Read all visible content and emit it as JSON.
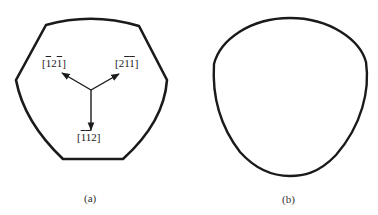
{
  "figure": {
    "panels": [
      {
        "id": "a",
        "caption": "(a)",
        "shape": "truncated-hexagonal cross-section",
        "directions": [
          {
            "label_prefix": "[",
            "parts": [
              {
                "t": "1",
                "bar": true
              },
              {
                "t": "2",
                "bar": false
              },
              {
                "t": "1",
                "bar": true
              }
            ],
            "label_suffix": "]",
            "text": "[-1 2 -1]"
          },
          {
            "label_prefix": "[",
            "parts": [
              {
                "t": "2",
                "bar": false
              },
              {
                "t": "1",
                "bar": true
              },
              {
                "t": "1",
                "bar": true
              }
            ],
            "label_suffix": "]",
            "text": "[2 -1 -1]"
          },
          {
            "label_prefix": "[",
            "parts": [
              {
                "t": "1",
                "bar": true
              },
              {
                "t": "1",
                "bar": true
              },
              {
                "t": "2",
                "bar": false
              }
            ],
            "label_suffix": "]",
            "text": "[-1 -1 2]"
          }
        ]
      },
      {
        "id": "b",
        "caption": "(b)",
        "shape": "rounded triangular cross-section"
      }
    ],
    "stroke_color": "#1a1a1a"
  }
}
